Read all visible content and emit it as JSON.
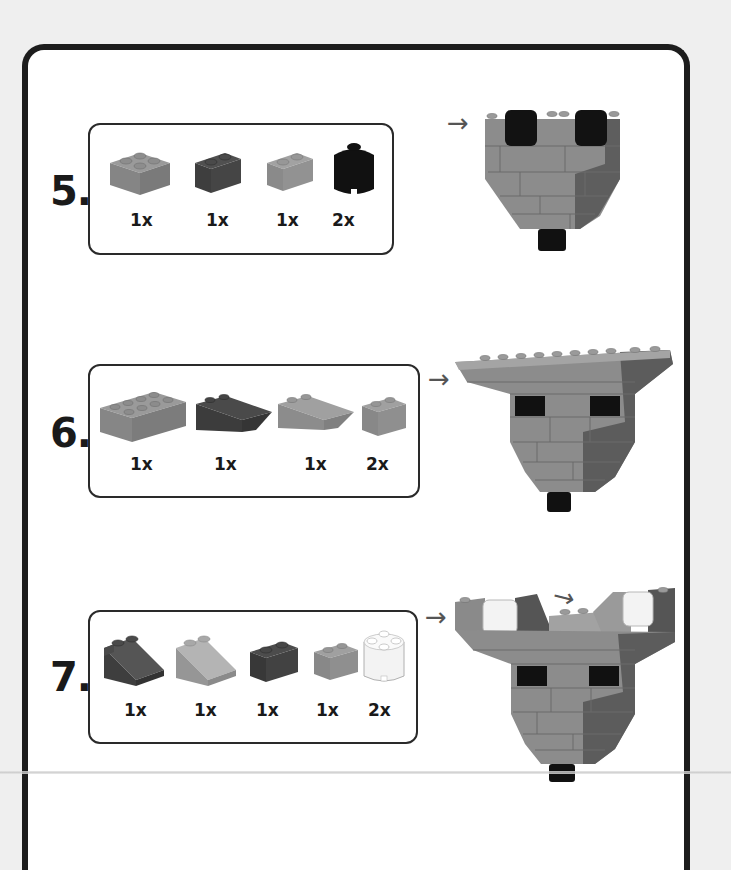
{
  "document": {
    "type": "building-instructions",
    "colors": {
      "frame": "#1d1d1d",
      "page_background": "#efefef",
      "card_background": "#ffffff",
      "brick_medium": "#8a8a8a",
      "brick_dark": "#4a4a4a",
      "brick_black": "#111111",
      "brick_white": "#f2f2f2",
      "arrow": "#555555"
    }
  },
  "steps": [
    {
      "number": "5.",
      "parts": [
        {
          "name": "brick-2x2-medium",
          "qty": "1x"
        },
        {
          "name": "brick-1x2-dark",
          "qty": "1x"
        },
        {
          "name": "brick-1x2-medium",
          "qty": "1x"
        },
        {
          "name": "round-brick-2x2-black",
          "qty": "2x"
        }
      ],
      "arrow": "→"
    },
    {
      "number": "6.",
      "parts": [
        {
          "name": "brick-2x4-medium",
          "qty": "1x"
        },
        {
          "name": "inverted-slope-dark",
          "qty": "1x"
        },
        {
          "name": "inverted-slope-medium",
          "qty": "1x"
        },
        {
          "name": "brick-1x2-medium",
          "qty": "2x"
        }
      ],
      "arrow": "→"
    },
    {
      "number": "7.",
      "parts": [
        {
          "name": "slope-2x2-dark",
          "qty": "1x"
        },
        {
          "name": "slope-2x2-light",
          "qty": "1x"
        },
        {
          "name": "brick-1x2-dark",
          "qty": "1x"
        },
        {
          "name": "brick-1x2-medium",
          "qty": "1x"
        },
        {
          "name": "round-brick-2x2-white",
          "qty": "2x"
        }
      ],
      "arrow": "→",
      "arrow_secondary": "→"
    }
  ]
}
